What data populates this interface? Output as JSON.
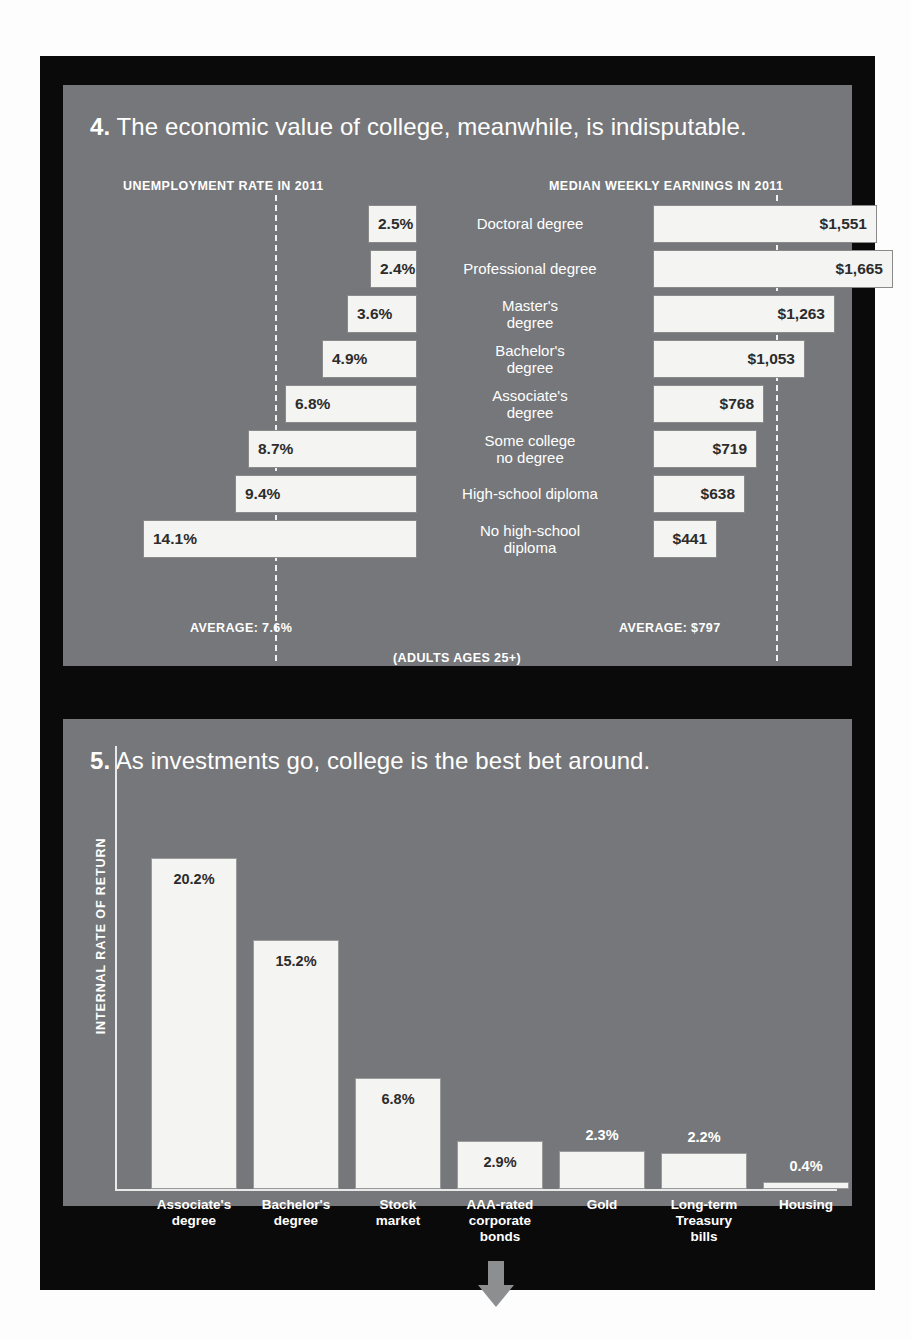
{
  "panel1": {
    "number": "4.",
    "headline": "The economic value of college, meanwhile, is indisputable.",
    "left_title": "UNEMPLOYMENT RATE IN 2011",
    "right_title": "MEDIAN WEEKLY EARNINGS IN 2011",
    "left_average_label": "AVERAGE: 7.6%",
    "right_average_label": "AVERAGE: $797",
    "footnote": "(ADULTS AGES 25+)"
  },
  "panel2": {
    "number": "5.",
    "headline": "As investments go, college is the best bet around.",
    "ylabel": "INTERNAL RATE OF RETURN"
  },
  "chart_data": [
    {
      "type": "bar",
      "orientation": "horizontal-diverging",
      "title": "The economic value of college, meanwhile, is indisputable.",
      "subtitle": "(ADULTS AGES 25+)",
      "categories": [
        "Doctoral degree",
        "Professional degree",
        "Master's\ndegree",
        "Bachelor's\ndegree",
        "Associate's\ndegree",
        "Some college\nno degree",
        "High-school diploma",
        "No high-school\ndiploma"
      ],
      "series": [
        {
          "name": "UNEMPLOYMENT RATE IN 2011",
          "xlabel": "Unemployment rate (%)",
          "direction": "left",
          "values": [
            2.5,
            2.4,
            3.6,
            4.9,
            6.8,
            8.7,
            9.4,
            14.1
          ],
          "labels": [
            "2.5%",
            "2.4%",
            "3.6%",
            "4.9%",
            "6.8%",
            "8.7%",
            "9.4%",
            "14.1%"
          ],
          "average": 7.6,
          "average_label": "AVERAGE: 7.6%"
        },
        {
          "name": "MEDIAN WEEKLY EARNINGS IN 2011",
          "xlabel": "Median weekly earnings ($)",
          "direction": "right",
          "values": [
            1551,
            1665,
            1263,
            1053,
            768,
            719,
            638,
            441
          ],
          "labels": [
            "$1,551",
            "$1,665",
            "$1,263",
            "$1,053",
            "$768",
            "$719",
            "$638",
            "$441"
          ],
          "average": 797,
          "average_label": "AVERAGE: $797"
        }
      ],
      "grid": false,
      "legend": "none"
    },
    {
      "type": "bar",
      "orientation": "vertical",
      "title": "As investments go, college is the best bet around.",
      "ylabel": "INTERNAL RATE OF RETURN",
      "xlabel": "",
      "categories": [
        "Associate's\ndegree",
        "Bachelor's\ndegree",
        "Stock\nmarket",
        "AAA-rated\ncorporate\nbonds",
        "Gold",
        "Long-term\nTreasury\nbills",
        "Housing"
      ],
      "values": [
        20.2,
        15.2,
        6.8,
        2.9,
        2.3,
        2.2,
        0.4
      ],
      "labels": [
        "20.2%",
        "15.2%",
        "6.8%",
        "2.9%",
        "2.3%",
        "2.2%",
        "0.4%"
      ],
      "ylim": [
        0,
        21
      ],
      "grid": false,
      "legend": "none"
    }
  ],
  "rows_left": [
    {
      "label": "2.5%",
      "width": 49,
      "offset": 0
    },
    {
      "label": "2.4%",
      "width": 47,
      "offset": 0
    },
    {
      "label": "3.6%",
      "width": 70,
      "offset": 0
    },
    {
      "label": "4.9%",
      "width": 95,
      "offset": 0
    },
    {
      "label": "6.8%",
      "width": 132,
      "offset": 0
    },
    {
      "label": "8.7%",
      "width": 169,
      "offset": 0
    },
    {
      "label": "9.4%",
      "width": 182,
      "offset": 0
    },
    {
      "label": "14.1%",
      "width": 274,
      "offset": 0
    }
  ],
  "rows_right": [
    {
      "label": "$1,551",
      "width": 224
    },
    {
      "label": "$1,665",
      "width": 240
    },
    {
      "label": "$1,263",
      "width": 182
    },
    {
      "label": "$1,053",
      "width": 152
    },
    {
      "label": "$768",
      "width": 111
    },
    {
      "label": "$719",
      "width": 104
    },
    {
      "label": "$638",
      "width": 92
    },
    {
      "label": "$441",
      "width": 64
    }
  ],
  "center_labels": [
    "Doctoral degree",
    "Professional degree",
    "Master's<br>degree",
    "Bachelor's<br>degree",
    "Associate's<br>degree",
    "Some college<br>no degree",
    "High-school diploma",
    "No high-school<br>diploma"
  ],
  "vbars": [
    {
      "label": "20.2%",
      "height": 331,
      "left": 36,
      "width": 86,
      "inside": true
    },
    {
      "label": "15.2%",
      "height": 249,
      "left": 138,
      "width": 86,
      "inside": true
    },
    {
      "label": "6.8%",
      "height": 111,
      "left": 240,
      "width": 86,
      "inside": true
    },
    {
      "label": "2.9%",
      "height": 48,
      "left": 342,
      "width": 86,
      "inside": true
    },
    {
      "label": "2.3%",
      "height": 38,
      "left": 444,
      "width": 86,
      "inside": false
    },
    {
      "label": "2.2%",
      "height": 36,
      "left": 546,
      "width": 86,
      "inside": false
    },
    {
      "label": "0.4%",
      "height": 7,
      "left": 648,
      "width": 86,
      "inside": false
    }
  ],
  "xcats": [
    "Associate's<br>degree",
    "Bachelor's<br>degree",
    "Stock<br>market",
    "AAA-rated<br>corporate<br>bonds",
    "Gold",
    "Long-term<br>Treasury<br>bills",
    "Housing"
  ],
  "colors": {
    "panel_bg": "#76777a",
    "frame": "#0a0a0a",
    "bar_fill": "#f4f4f2",
    "text_light": "#ffffff",
    "text_dark": "#2c2c2c",
    "arrow": "#8d8e90"
  }
}
